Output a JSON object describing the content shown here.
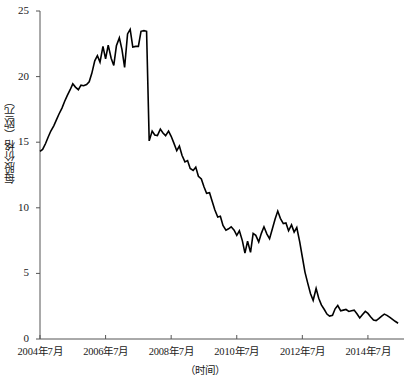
{
  "chart_data": {
    "type": "line",
    "title": "",
    "subtitle": "",
    "xlabel": "（时间）",
    "ylabel": "每股价格（欧元）",
    "xlim": [
      2004.5,
      2015.6
    ],
    "ylim": [
      0,
      25
    ],
    "grid": false,
    "legend": null,
    "line_color": "#000000",
    "axis_color": "#555555",
    "y_ticks": [
      0,
      5,
      10,
      15,
      20,
      25
    ],
    "y_tick_labels": [
      "0",
      "5",
      "10",
      "15",
      "20",
      "25"
    ],
    "x_ticks": [
      2004.5,
      2006.5,
      2008.5,
      2010.5,
      2012.5,
      2014.5
    ],
    "x_tick_labels": [
      "2004年7月",
      "2006年7月",
      "2008年7月",
      "2010年7月",
      "2012年7月",
      "2014年7月"
    ],
    "series": [
      {
        "name": "每股价格",
        "x": [
          2004.5,
          2004.58,
          2004.67,
          2004.75,
          2004.83,
          2004.92,
          2005.0,
          2005.08,
          2005.17,
          2005.25,
          2005.33,
          2005.42,
          2005.5,
          2005.58,
          2005.67,
          2005.75,
          2005.83,
          2005.92,
          2006.0,
          2006.08,
          2006.17,
          2006.25,
          2006.33,
          2006.42,
          2006.5,
          2006.58,
          2006.67,
          2006.75,
          2006.83,
          2006.92,
          2007.0,
          2007.08,
          2007.17,
          2007.25,
          2007.33,
          2007.42,
          2007.5,
          2007.58,
          2007.67,
          2007.75,
          2007.83,
          2007.92,
          2008.0,
          2008.08,
          2008.17,
          2008.25,
          2008.33,
          2008.42,
          2008.5,
          2008.58,
          2008.67,
          2008.75,
          2008.83,
          2008.92,
          2009.0,
          2009.08,
          2009.17,
          2009.25,
          2009.33,
          2009.42,
          2009.5,
          2009.58,
          2009.67,
          2009.75,
          2009.83,
          2009.92,
          2010.0,
          2010.08,
          2010.17,
          2010.25,
          2010.33,
          2010.42,
          2010.5,
          2010.58,
          2010.67,
          2010.75,
          2010.83,
          2010.92,
          2011.0,
          2011.08,
          2011.17,
          2011.25,
          2011.33,
          2011.42,
          2011.5,
          2011.58,
          2011.67,
          2011.75,
          2011.83,
          2011.92,
          2012.0,
          2012.08,
          2012.17,
          2012.25,
          2012.33,
          2012.42,
          2012.5,
          2012.58,
          2012.67,
          2012.75,
          2012.83,
          2012.92,
          2013.0,
          2013.08,
          2013.17,
          2013.25,
          2013.33,
          2013.42,
          2013.5,
          2013.58,
          2013.67,
          2013.75,
          2013.83,
          2013.92,
          2014.0,
          2014.08,
          2014.17,
          2014.25,
          2014.33,
          2014.42,
          2014.5,
          2014.58,
          2014.67,
          2014.75,
          2014.83,
          2014.92,
          2015.0,
          2015.08,
          2015.17,
          2015.25,
          2015.33,
          2015.42
        ],
        "values": [
          14.3,
          14.45,
          14.9,
          15.4,
          15.85,
          16.25,
          16.7,
          17.15,
          17.6,
          18.1,
          18.55,
          19.0,
          19.45,
          19.2,
          19.0,
          19.35,
          19.3,
          19.4,
          19.6,
          20.25,
          21.2,
          21.6,
          21.1,
          22.3,
          21.35,
          22.4,
          21.4,
          20.85,
          22.35,
          22.95,
          22.05,
          20.7,
          23.25,
          23.6,
          22.25,
          22.3,
          22.3,
          23.45,
          23.5,
          23.45,
          15.1,
          15.85,
          15.55,
          15.5,
          16.0,
          15.7,
          15.5,
          15.85,
          15.45,
          14.95,
          14.35,
          14.7,
          14.0,
          13.5,
          13.6,
          13.0,
          12.85,
          13.1,
          12.4,
          12.2,
          11.6,
          11.1,
          11.15,
          10.5,
          9.85,
          9.3,
          9.35,
          8.65,
          8.3,
          8.4,
          8.55,
          8.3,
          7.9,
          8.25,
          7.5,
          6.55,
          7.45,
          6.6,
          8.05,
          7.9,
          7.4,
          8.05,
          8.55,
          8.0,
          7.65,
          8.35,
          9.15,
          9.75,
          9.2,
          8.8,
          8.85,
          8.25,
          8.7,
          8.15,
          8.5,
          7.4,
          6.25,
          5.1,
          4.2,
          3.45,
          2.95,
          3.85,
          3.1,
          2.6,
          2.25,
          1.9,
          1.75,
          1.8,
          2.3,
          2.55,
          2.15,
          2.2,
          2.25,
          2.1,
          2.15,
          2.2,
          1.9,
          1.6,
          1.85,
          2.1,
          1.95,
          1.7,
          1.45,
          1.4,
          1.55,
          1.75,
          1.9,
          1.8,
          1.65,
          1.5,
          1.35,
          1.2
        ]
      }
    ]
  }
}
